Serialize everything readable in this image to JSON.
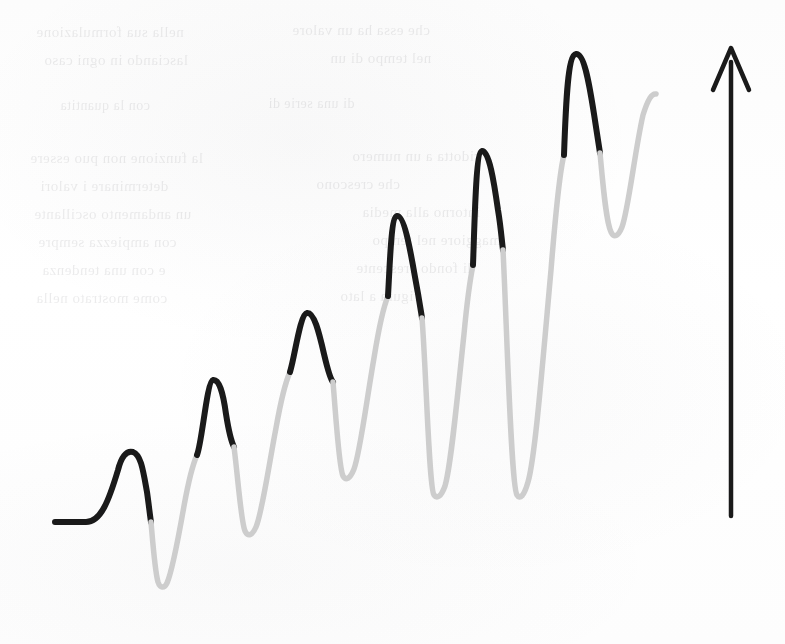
{
  "figure": {
    "canvas": {
      "width": 785,
      "height": 644
    },
    "background_color": "#fdfdfd"
  },
  "style": {
    "dark_stroke_color": "#1a1a1a",
    "light_stroke_color": "#cdcdcd",
    "arrow_color": "#1a1a1a",
    "stroke_width": 6,
    "light_stroke_width": 5.5,
    "arrow_stroke_width": 4.5
  },
  "chart_data": {
    "type": "line",
    "subtitle": "",
    "xlabel": "",
    "ylabel": "",
    "xlim": [
      0,
      785
    ],
    "ylim": [
      644,
      0
    ],
    "grid": false,
    "legend": "none",
    "series": [
      {
        "name": "rising-oscillation",
        "point_type": "pixel-coordinates",
        "key_points": [
          {
            "label": "start-flat",
            "x": 55,
            "y": 522,
            "kind": "baseline"
          },
          {
            "label": "peak-1",
            "x": 122,
            "y": 450,
            "kind": "peak"
          },
          {
            "label": "trough-1",
            "x": 162,
            "y": 588,
            "kind": "trough"
          },
          {
            "label": "peak-2",
            "x": 212,
            "y": 380,
            "kind": "peak"
          },
          {
            "label": "trough-2",
            "x": 248,
            "y": 536,
            "kind": "trough"
          },
          {
            "label": "peak-3",
            "x": 305,
            "y": 313,
            "kind": "peak"
          },
          {
            "label": "trough-3",
            "x": 344,
            "y": 478,
            "kind": "trough"
          },
          {
            "label": "peak-4",
            "x": 392,
            "y": 215,
            "kind": "peak"
          },
          {
            "label": "trough-4",
            "x": 432,
            "y": 497,
            "kind": "trough"
          },
          {
            "label": "peak-5",
            "x": 477,
            "y": 150,
            "kind": "peak"
          },
          {
            "label": "trough-5",
            "x": 520,
            "y": 497,
            "kind": "trough"
          },
          {
            "label": "peak-6",
            "x": 576,
            "y": 53,
            "kind": "peak"
          },
          {
            "label": "trough-6",
            "x": 620,
            "y": 237,
            "kind": "trough"
          },
          {
            "label": "end-tail",
            "x": 656,
            "y": 95,
            "kind": "endpoint"
          }
        ],
        "peak_count": 6,
        "trough_count": 6,
        "amplitude_trend": "increasing",
        "mean_trend": "increasing"
      }
    ],
    "annotations": [
      {
        "name": "up-arrow",
        "kind": "arrow",
        "direction": "up",
        "x": 731,
        "y_top": 47,
        "y_bottom": 516,
        "head_half_width": 18,
        "head_height": 42
      }
    ]
  },
  "curve_segments": [
    {
      "id": "seg-1-dark",
      "shade": "dark",
      "d": "M 55 522 L 86 522 C 101 522 109 500 118 470 C 121 458 126 450 133 452 C 141 455 143 470 147 492 C 149 506 150 516 151 522"
    },
    {
      "id": "seg-1-light",
      "shade": "light",
      "d": "M 151 522 C 153 545 155 572 158 582 C 160 588 164 589 167 583 C 172 572 178 540 184 506 C 188 484 192 466 197 455"
    },
    {
      "id": "seg-2-dark",
      "shade": "dark",
      "d": "M 197 455 C 202 443 207 381 213 380 C 219 379 223 392 226 414 C 229 433 232 443 234 447"
    },
    {
      "id": "seg-2-light",
      "shade": "light",
      "d": "M 234 447 C 238 478 241 522 245 531 C 248 537 252 536 256 527 C 262 513 268 470 276 428 C 281 400 285 383 290 372"
    },
    {
      "id": "seg-3-dark",
      "shade": "dark",
      "d": "M 290 372 C 295 356 300 314 307 313 C 314 312 319 332 324 354 C 328 371 331 380 333 382"
    },
    {
      "id": "seg-3-light",
      "shade": "light",
      "d": "M 333 382 C 336 418 339 468 343 476 C 346 481 350 479 354 469 C 360 453 366 404 374 358 C 379 327 383 308 388 296"
    },
    {
      "id": "seg-4-dark",
      "shade": "dark",
      "d": "M 388 296 C 390 262 391 217 397 216 C 404 215 410 248 415 277 C 419 298 421 312 422 318"
    },
    {
      "id": "seg-4-light",
      "shade": "light",
      "d": "M 422 318 C 426 368 429 488 434 495 C 437 499 441 497 445 486 C 451 466 457 400 464 334 C 467 302 470 280 473 265"
    },
    {
      "id": "seg-5-dark",
      "shade": "dark",
      "d": "M 473 265 C 475 210 476 152 482 151 C 489 150 494 182 498 210 C 501 228 502 243 503 250"
    },
    {
      "id": "seg-5-light",
      "shade": "light",
      "d": "M 503 250 C 507 330 511 486 517 495 C 520 500 524 496 528 482 C 535 458 542 370 551 270 C 556 208 560 170 564 155"
    },
    {
      "id": "seg-6-dark",
      "shade": "dark",
      "d": "M 564 155 C 566 98 568 55 576 54 C 584 53 589 82 594 114 C 597 134 599 147 600 153"
    },
    {
      "id": "seg-6-light",
      "shade": "light",
      "d": "M 600 153 C 603 185 606 222 611 232 C 614 238 618 237 622 227 C 628 212 635 150 643 115 C 648 99 652 93 656 94"
    }
  ],
  "arrow_path": {
    "shaft_d": "M 731 62 L 731 516",
    "head_d": "M 713 90 L 731 48 L 749 90"
  },
  "ghost_text": {
    "description": "Illegible bleed-through of printed text from the reverse side of the page",
    "lines": [
      {
        "text": "nella sua formulazione",
        "x": 36,
        "y": 24,
        "size": 15
      },
      {
        "text": "che essa ha un valore",
        "x": 292,
        "y": 22,
        "size": 15
      },
      {
        "text": "lasciando in ogni caso",
        "x": 44,
        "y": 52,
        "size": 15
      },
      {
        "text": "nel tempo di un",
        "x": 330,
        "y": 50,
        "size": 15
      },
      {
        "text": "con la quantita",
        "x": 60,
        "y": 98,
        "size": 14
      },
      {
        "text": "di una serie di",
        "x": 268,
        "y": 96,
        "size": 14
      },
      {
        "text": "la funzione non puo essere",
        "x": 30,
        "y": 150,
        "size": 15
      },
      {
        "text": "ridotta a un numero",
        "x": 352,
        "y": 148,
        "size": 15
      },
      {
        "text": "determinare i valori",
        "x": 40,
        "y": 178,
        "size": 15
      },
      {
        "text": "che crescono",
        "x": 316,
        "y": 176,
        "size": 15
      },
      {
        "text": "un andamento oscillante",
        "x": 34,
        "y": 206,
        "size": 15
      },
      {
        "text": "intorno alla media",
        "x": 362,
        "y": 204,
        "size": 15
      },
      {
        "text": "con ampiezza sempre",
        "x": 38,
        "y": 234,
        "size": 15
      },
      {
        "text": "maggiore nel tempo",
        "x": 372,
        "y": 232,
        "size": 15
      },
      {
        "text": "e con una tendenza",
        "x": 42,
        "y": 262,
        "size": 15
      },
      {
        "text": "di fondo crescente",
        "x": 356,
        "y": 260,
        "size": 15
      },
      {
        "text": "come mostrato nella",
        "x": 36,
        "y": 290,
        "size": 15
      },
      {
        "text": "figura a lato",
        "x": 340,
        "y": 288,
        "size": 15
      }
    ]
  }
}
